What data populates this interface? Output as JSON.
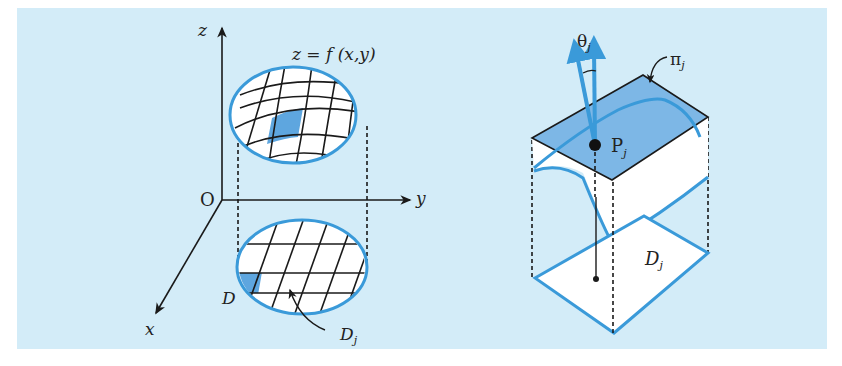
{
  "diagram": {
    "left_figure": {
      "axes": {
        "z_label": "z",
        "y_label": "y",
        "x_label": "x",
        "origin_label": "O"
      },
      "surface_label": "z = f (x,y)",
      "region_label": "D",
      "subregion_label": "D",
      "subregion_subscript": "j"
    },
    "right_figure": {
      "angle_label": "θ",
      "angle_subscript": "j",
      "plane_label": "π",
      "plane_subscript": "j",
      "point_label": "P",
      "point_subscript": "j",
      "region_label": "D",
      "region_subscript": "j"
    },
    "colors": {
      "background": "#d3ecf8",
      "accent_blue": "#3a9ad9",
      "fill_blue": "#5ea6df",
      "plane_fill": "#7db7e6",
      "ink": "#1a1a1a"
    }
  }
}
